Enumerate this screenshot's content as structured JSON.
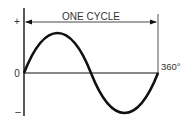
{
  "diagram": {
    "title": "ONE CYCLE",
    "axis_labels": {
      "positive": "+",
      "zero": "0",
      "negative": "–",
      "end_degree": "360°"
    },
    "colors": {
      "stroke": "#111111",
      "text": "#333333",
      "background": "#ffffff"
    },
    "wave": {
      "type": "sine",
      "start_degree": 0,
      "end_degree": 360,
      "cycles": 1
    }
  }
}
